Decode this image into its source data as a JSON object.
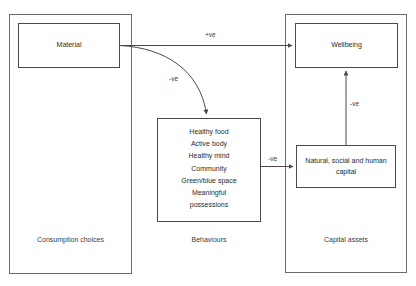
{
  "diagram": {
    "colors": {
      "stroke": "#4a4a4a",
      "container_stroke": "#6b6b6b",
      "text": "#2b2b2b",
      "background": "#ffffff"
    },
    "groups": [
      {
        "id": "consumption",
        "label": "Consumption choices"
      },
      {
        "id": "behaviours",
        "label": "Behaviours"
      },
      {
        "id": "capital",
        "label": "Capital assets"
      }
    ],
    "nodes": {
      "material": {
        "label": "Material"
      },
      "wellbeing": {
        "label": "Wellbeing"
      },
      "capital": {
        "label": "Natural, social and human capital"
      },
      "behaviours_list": {
        "items": [
          "Healthy food",
          "Active body",
          "Healthy mind",
          "Community",
          "Green/blue space",
          "Meaningful",
          "possessions"
        ]
      }
    },
    "edges": [
      {
        "id": "material-to-wellbeing",
        "from": "material",
        "to": "wellbeing",
        "label": "+ve",
        "shape": "straight"
      },
      {
        "id": "material-to-behaviours",
        "from": "material",
        "to": "behaviours_list",
        "label": "-ve",
        "shape": "curved"
      },
      {
        "id": "behaviours-to-capital",
        "from": "behaviours_list",
        "to": "capital",
        "label": "-ve",
        "shape": "straight"
      },
      {
        "id": "capital-to-wellbeing",
        "from": "capital",
        "to": "wellbeing",
        "label": "-ve",
        "shape": "straight"
      }
    ]
  }
}
